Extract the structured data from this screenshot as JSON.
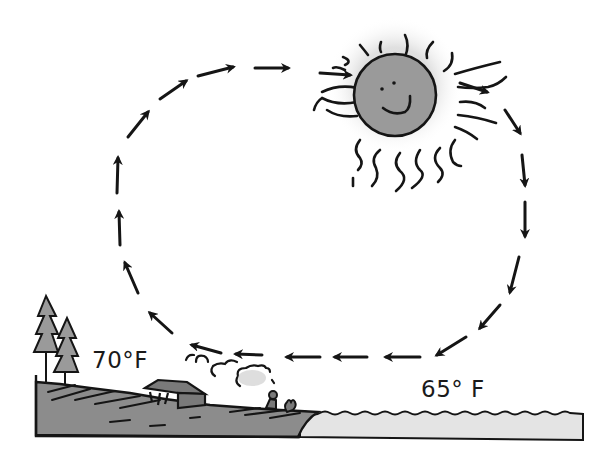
{
  "diagram": {
    "type": "sea-breeze-circulation",
    "labels": {
      "land_temp": "70°F",
      "water_temp": "65° F"
    },
    "elements": {
      "sun": {
        "face": "smiling",
        "fill": "#9a9a9a"
      },
      "land": {
        "fill": "#8c8c8c",
        "features": [
          "two pine trees",
          "house/barn",
          "campfire smoke",
          "person sitting",
          "shrub"
        ]
      },
      "water": {
        "fill": "#e4e4e4"
      },
      "circulation": {
        "direction": "clockwise",
        "arrow_count": 22
      }
    },
    "colors": {
      "ink": "#151515",
      "sun": "#9a9a9a",
      "land": "#8c8c8c",
      "water": "#e4e4e4",
      "background": "#ffffff"
    }
  }
}
